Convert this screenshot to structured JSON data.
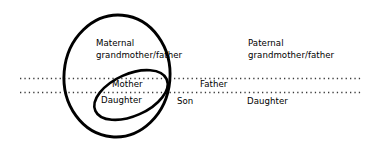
{
  "diagram": {
    "background_color": "#ffffff",
    "stroke_color": "#000000",
    "dotted_line_color": "#3a3a3a",
    "labels": {
      "maternal_line1": "Maternal",
      "maternal_line2": "grandmother/father",
      "paternal_line1": "Paternal",
      "paternal_line2": "grandmother/father",
      "mother": "Mother",
      "father": "Father",
      "daughter_left": "Daughter",
      "son": "Son",
      "daughter_right": "Daughter"
    },
    "shapes": {
      "outer_ellipse_name": "maternal-lineage-ellipse",
      "inner_ellipse_name": "mother-daughter-ellipse",
      "divider_top_name": "generation-divider-upper",
      "divider_bottom_name": "generation-divider-lower"
    }
  }
}
